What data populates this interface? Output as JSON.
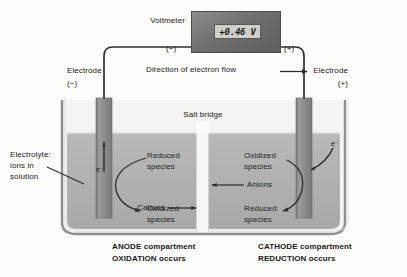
{
  "diagram": {
    "voltmeter": {
      "label": "Voltmeter",
      "reading": "+0.46 V",
      "terminal_negative": "(−)",
      "terminal_positive": "(+)"
    },
    "circuit": {
      "electron_flow_label": "Direction of electron flow"
    },
    "left_electrode": {
      "label": "Electrode",
      "polarity": "(−)",
      "electron_label": "e⁻"
    },
    "right_electrode": {
      "label": "Electrode",
      "polarity": "(+)",
      "electron_label": "e⁻"
    },
    "salt_bridge": {
      "label": "Salt bridge"
    },
    "electrolyte": {
      "line1": "Electrolyte:",
      "line2": "ions in",
      "line3": "solution"
    },
    "anode_half_cell": {
      "species_top_line1": "Reduced",
      "species_top_line2": "species",
      "species_bottom_line1": "Oxidized",
      "species_bottom_line2": "species",
      "caption_line1": "ANODE compartment",
      "caption_line2": "OXIDATION occurs"
    },
    "cathode_half_cell": {
      "species_top_line1": "Oxidized",
      "species_top_line2": "species",
      "species_bottom_line1": "Reduced",
      "species_bottom_line2": "species",
      "caption_line1": "CATHODE compartment",
      "caption_line2": "REDUCTION occurs"
    },
    "ion_migration": {
      "anions_label": "Anions",
      "cations_label": "Cations"
    },
    "colors": {
      "solution": "#b3b3b3",
      "electrode": "#8c8c8c",
      "voltmeter_case": "#6f6f6f",
      "display": "#cfcfc9",
      "wire": "#3a3a3a",
      "beaker_wall": "#9a9a9a",
      "text": "#1a1a1a"
    }
  }
}
